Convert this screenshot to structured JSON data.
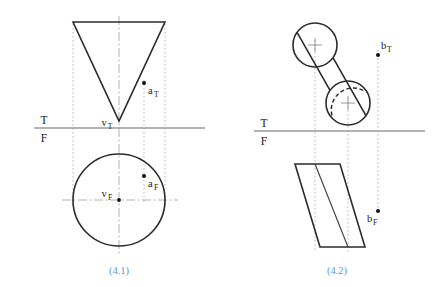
{
  "page": {
    "background_color": "#ffffff",
    "width": 440,
    "height": 287
  },
  "figures": [
    {
      "id": "figure-4-1",
      "caption": "(4.1)",
      "caption_color": "#5b9bd5",
      "caption_pos": {
        "x": 119,
        "y": 272
      },
      "fold_line": {
        "top_label": "T",
        "bottom_label": "F",
        "top_label_pos": {
          "x": 44,
          "y": 121
        },
        "bottom_label_pos": {
          "x": 44,
          "y": 141
        },
        "y": 128,
        "x1": 34,
        "x2": 205,
        "color": "#9a9a9a"
      },
      "top_view": {
        "shape": "triangle",
        "description": "inverted triangle (top view of cone)",
        "vertices": [
          {
            "x": 73,
            "y": 22
          },
          {
            "x": 165,
            "y": 22
          },
          {
            "x": 119,
            "y": 121
          }
        ],
        "apex_label": "v",
        "apex_subscript": "T",
        "apex_label_pos": {
          "x": 104,
          "y": 125
        }
      },
      "front_view": {
        "shape": "circle",
        "description": "circle (front view of cone)",
        "center": {
          "x": 119,
          "y": 200
        },
        "radius": 46,
        "center_label": "v",
        "center_subscript": "F",
        "center_label_pos": {
          "x": 104,
          "y": 196
        }
      },
      "points": [
        {
          "name": "a_T",
          "label": "a",
          "subscript": "T",
          "x": 144,
          "y": 83,
          "label_pos": {
            "x": 147,
            "y": 93
          }
        },
        {
          "name": "a_F",
          "label": "a",
          "subscript": "F",
          "x": 144,
          "y": 176,
          "label_pos": {
            "x": 147,
            "y": 187
          }
        }
      ],
      "center_axis_x": 119,
      "center_axis_y": 200,
      "projector_xs": [
        73,
        144,
        165
      ]
    },
    {
      "id": "figure-4-2",
      "caption": "(4.2)",
      "caption_color": "#5b9bd5",
      "caption_pos": {
        "x": 337,
        "y": 272
      },
      "fold_line": {
        "top_label": "T",
        "bottom_label": "F",
        "top_label_pos": {
          "x": 264,
          "y": 121
        },
        "bottom_label_pos": {
          "x": 264,
          "y": 141
        },
        "y": 131,
        "x1": 254,
        "x2": 425,
        "color": "#9a9a9a"
      },
      "top_view": {
        "shape": "cylinder",
        "description": "oblique cylinder top view: two circles with tangent silhouette lines",
        "circle_far": {
          "cx": 315,
          "cy": 45,
          "r": 22
        },
        "circle_near": {
          "cx": 348,
          "cy": 103,
          "r": 22
        },
        "hidden_arc": "dashed arc on upper-left of near circle",
        "cross_size": 7
      },
      "front_view": {
        "shape": "parallelogram",
        "description": "oblique cylinder front view as a parallelogram with interior element line",
        "vertices": [
          {
            "x": 295,
            "y": 164
          },
          {
            "x": 340,
            "y": 164
          },
          {
            "x": 365,
            "y": 247
          },
          {
            "x": 320,
            "y": 247
          }
        ],
        "element_line": [
          {
            "x": 315,
            "y": 164
          },
          {
            "x": 348,
            "y": 247
          }
        ]
      },
      "points": [
        {
          "name": "b_T",
          "label": "b",
          "subscript": "T",
          "x": 378,
          "y": 55,
          "label_pos": {
            "x": 381,
            "y": 48
          }
        },
        {
          "name": "b_F",
          "label": "b",
          "subscript": "F",
          "x": 378,
          "y": 211,
          "label_pos": {
            "x": 366,
            "y": 222
          }
        }
      ],
      "projector_xs": [
        315,
        348,
        378
      ]
    }
  ]
}
